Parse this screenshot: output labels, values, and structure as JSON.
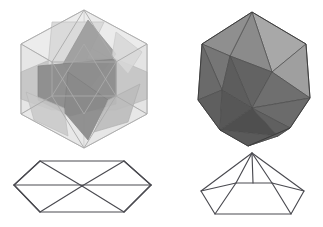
{
  "document": {
    "title": "Icosahedron geometric figure plate",
    "background_color": "#ffffff",
    "width": 323,
    "height": 227,
    "caption": "",
    "figure_count": 4
  },
  "palette": {
    "page_background": "#ffffff",
    "wire_stroke": "#4a4a50",
    "translucent_edge": "#b9b9b9",
    "translucent_pale": "#ededed",
    "translucent_light": "#dcdcdc",
    "translucent_mid": "#bdbdbd",
    "translucent_core": "#8e8e8e",
    "translucent_core_dark": "#7e7e7e",
    "opaque_highlight": "#adadad",
    "opaque_light": "#9a9a9a",
    "opaque_mid": "#8a8a8a",
    "opaque_shadow": "#6e6e6e",
    "opaque_dark": "#5d5d5d",
    "opaque_darkest": "#4f4f4f",
    "opaque_edge": "#3e3e3e"
  },
  "figures": [
    {
      "id": "solid-transparent",
      "name": "transparent-icosahedron",
      "label": "",
      "type": "polyhedron",
      "rendering": "translucent-wireframe-shaded",
      "silhouette": "hexagon",
      "description": "Semi-transparent icosahedron viewed down a 3-fold axis; interior faces visible through the hull forming a pinwheel of darker triangles.",
      "position": "top-left",
      "bbox": [
        8,
        4,
        152,
        148
      ]
    },
    {
      "id": "solid-opaque",
      "name": "opaque-icosahedron",
      "label": "",
      "type": "polyhedron",
      "rendering": "opaque-flat-shaded",
      "silhouette": "decagon",
      "description": "Opaque grey icosahedron with flat-shaded triangular faces, lit from the upper right.",
      "position": "top-right",
      "bbox": [
        186,
        4,
        132,
        148
      ]
    },
    {
      "id": "wire-antiprism",
      "name": "flattened-antiprism-wireframe",
      "label": "",
      "type": "wireframe",
      "rendering": "line-drawing",
      "silhouette": "elongated-hexagon",
      "description": "Edge-on wireframe projection: wide flattened hexagon crossed by two long diagonals meeting at the centre.",
      "position": "bottom-left",
      "bbox": [
        10,
        155,
        145,
        66
      ]
    },
    {
      "id": "wire-pyramid",
      "name": "pentagonal-pyramid-wireframe",
      "label": "",
      "type": "wireframe",
      "rendering": "line-drawing",
      "silhouette": "pentagon-with-apex",
      "description": "Wireframe pentagonal pyramid: a pentagon base in perspective with five edges converging on a top apex and an inner ridge line.",
      "position": "bottom-right",
      "bbox": [
        196,
        150,
        112,
        70
      ]
    }
  ]
}
